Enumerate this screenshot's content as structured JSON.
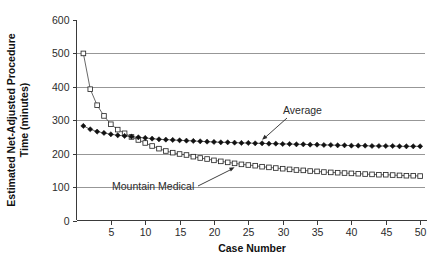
{
  "chart_data": {
    "type": "line",
    "title": "",
    "xlabel": "Case Number",
    "ylabel": "Estimated Net-Adjusted Procedure Time (minutes)",
    "ylabel_line1": "Estimated Net-Adjusted Procedure",
    "ylabel_line2": "Time (minutes)",
    "xlim": [
      0,
      51
    ],
    "ylim": [
      0,
      600
    ],
    "grid": true,
    "grid_axis": "y",
    "legend_position": "none",
    "y_ticks": [
      0,
      100,
      200,
      300,
      400,
      500,
      600
    ],
    "y_tick_labels": [
      "0",
      "100",
      "200",
      "300",
      "400",
      "500",
      "600"
    ],
    "x_ticks": [
      5,
      10,
      15,
      20,
      25,
      30,
      35,
      40,
      45,
      50
    ],
    "x_tick_labels": [
      "5",
      "10",
      "15",
      "20",
      "25",
      "30",
      "35",
      "40",
      "45",
      "50"
    ],
    "x": [
      1,
      2,
      3,
      4,
      5,
      6,
      7,
      8,
      9,
      10,
      11,
      12,
      13,
      14,
      15,
      16,
      17,
      18,
      19,
      20,
      21,
      22,
      23,
      24,
      25,
      26,
      27,
      28,
      29,
      30,
      31,
      32,
      33,
      34,
      35,
      36,
      37,
      38,
      39,
      40,
      41,
      42,
      43,
      44,
      45,
      46,
      47,
      48,
      49,
      50
    ],
    "series": [
      {
        "name": "Mountain Medical",
        "marker": "open-square",
        "values": [
          500,
          393,
          345,
          313,
          288,
          272,
          261,
          250,
          241,
          232,
          223,
          215,
          208,
          203,
          199,
          196,
          191,
          187,
          184,
          180,
          177,
          174,
          171,
          168,
          166,
          164,
          161,
          159,
          157,
          155,
          153,
          151,
          150,
          148,
          147,
          145,
          144,
          143,
          142,
          141,
          140,
          139,
          138,
          137,
          137,
          136,
          135,
          134,
          134,
          133
        ]
      },
      {
        "name": "Average",
        "marker": "filled-diamond",
        "values": [
          283,
          273,
          266,
          262,
          258,
          255,
          253,
          251,
          249,
          247,
          245,
          243,
          242,
          241,
          240,
          239,
          238,
          237,
          236,
          235,
          234,
          234,
          233,
          232,
          232,
          231,
          231,
          230,
          230,
          229,
          229,
          228,
          228,
          227,
          227,
          226,
          226,
          225,
          225,
          224,
          224,
          224,
          223,
          223,
          223,
          223,
          222,
          222,
          222,
          222
        ]
      }
    ],
    "annotations": [
      {
        "label": "Average",
        "target_x": 27,
        "target_y": 231
      },
      {
        "label": "Mountain Medical",
        "target_x": 23,
        "target_y": 171
      }
    ]
  }
}
